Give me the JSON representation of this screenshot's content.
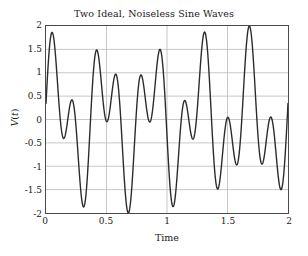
{
  "chart_data": {
    "type": "line",
    "title": "Two Ideal, Noiseless Sine Waves",
    "xlabel": "Time",
    "ylabel": "V(t)",
    "xlim": [
      0,
      2
    ],
    "ylim": [
      -2,
      2
    ],
    "xticks": [
      "0",
      "0.5",
      "1",
      "1.5",
      "2"
    ],
    "xtick_values": [
      0,
      0.5,
      1,
      1.5,
      2
    ],
    "yticks": [
      "2",
      "1.5",
      "1",
      "0.5",
      "0",
      "-0.5",
      "-1",
      "-1.5",
      "-2"
    ],
    "ytick_values": [
      2,
      1.5,
      1,
      0.5,
      0,
      -0.5,
      -1,
      -1.5,
      -2
    ],
    "grid": true,
    "legend": "none",
    "line_color": "#2b2b2b",
    "line_width": 1.4,
    "grid_color": "#b9b9b9",
    "axis_color": "#4a4a4a",
    "background": "#ffffff",
    "series": [
      {
        "name": "sum of two sine waves",
        "description": "V(t) = sin(2*pi*2.5*t + 0.3) + sin(2*pi*5.5*t + 0.05)",
        "components": [
          {
            "amplitude": 1.0,
            "frequency": 2.5,
            "phase": 0.3
          },
          {
            "amplitude": 1.0,
            "frequency": 5.5,
            "phase": 0.05
          }
        ],
        "npoints": 801,
        "observed_extrema": {
          "max": 1.88,
          "max_at_t": 1.02,
          "min": -1.88,
          "min_at_t": 0.54
        }
      }
    ]
  }
}
